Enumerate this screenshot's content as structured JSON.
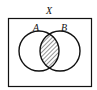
{
  "diagram": {
    "type": "venn",
    "universal_set_label": "X",
    "sets": [
      {
        "label": "A"
      },
      {
        "label": "B"
      }
    ],
    "shaded_region": "A ∩ B",
    "colors": {
      "stroke": "#111111",
      "background": "#ffffff"
    }
  }
}
